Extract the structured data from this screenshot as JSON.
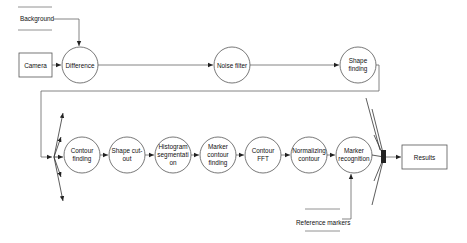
{
  "diagram": {
    "data_stores": {
      "background": "Background",
      "reference_markers": "Reference markers"
    },
    "external_entities": {
      "camera": "Camera",
      "results": "Results"
    },
    "processes": {
      "difference": "Difference",
      "noise_filter": "Noise filter",
      "shape_finding": [
        "Shape",
        "finding"
      ],
      "contour_finding": [
        "Contour",
        "finding"
      ],
      "shape_cut_out": [
        "Shape cut-",
        "out"
      ],
      "histogram_segmentation": [
        "Histogram",
        "segmentati",
        "on"
      ],
      "marker_contour_finding": [
        "Marker",
        "contour",
        "finding"
      ],
      "contour_fft": [
        "Contour",
        "FFT"
      ],
      "normalizing_contour": [
        "Normalizing",
        "contour"
      ],
      "marker_recognition": [
        "Marker",
        "recognition"
      ]
    },
    "colors": {
      "line": "#666666",
      "node_stroke": "#555555",
      "text": "#111111"
    }
  }
}
